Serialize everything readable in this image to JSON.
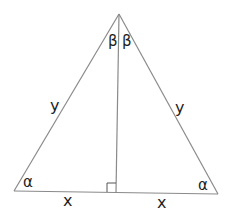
{
  "diagram": {
    "type": "isosceles-triangle-with-altitude",
    "colors": {
      "stroke": "#8a8a8a",
      "text": "#1e1e1e",
      "background": "#ffffff"
    },
    "labels": {
      "apex_left_angle": "β",
      "apex_right_angle": "β",
      "left_side": "y",
      "right_side": "y",
      "left_base_angle": "α",
      "right_base_angle": "α",
      "left_base_segment": "x",
      "right_base_segment": "x"
    },
    "right_angle_marker": true
  }
}
